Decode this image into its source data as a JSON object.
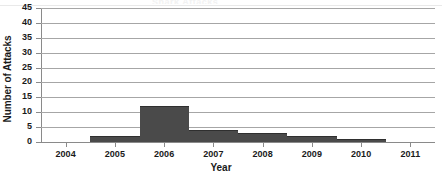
{
  "chart_data": {
    "type": "bar",
    "title": "",
    "title_remnant": "Shark Attacks",
    "xlabel": "Year",
    "ylabel": "Number of Attacks",
    "categories": [
      "2004",
      "2005",
      "2006",
      "2007",
      "2008",
      "2009",
      "2010",
      "2011"
    ],
    "values": [
      0,
      2,
      12,
      4,
      3,
      2,
      1,
      0
    ],
    "x": [
      2004,
      2005,
      2006,
      2007,
      2008,
      2009,
      2010,
      2011
    ],
    "xtick_labels": [
      "2004",
      "2005",
      "2006",
      "2007",
      "2008",
      "2009",
      "2010",
      "2011"
    ],
    "ytick_labels": [
      "45",
      "40",
      "35",
      "30",
      "25",
      "20",
      "15",
      "10",
      "5",
      "0"
    ],
    "ytick_values": [
      45,
      40,
      35,
      30,
      25,
      20,
      15,
      10,
      5,
      0
    ],
    "ylim": [
      0,
      45
    ],
    "xlim": [
      2003.5,
      2011.5
    ],
    "ystep": 5,
    "grid": "horizontal",
    "legend": "none",
    "bar_color": "#4a4a4a",
    "gridline_color": "#a6a6a6",
    "axis_color": "#8a8a8a",
    "background": "#ffffff",
    "bar_align": "centered-on-tick",
    "bar_gap": 0
  }
}
